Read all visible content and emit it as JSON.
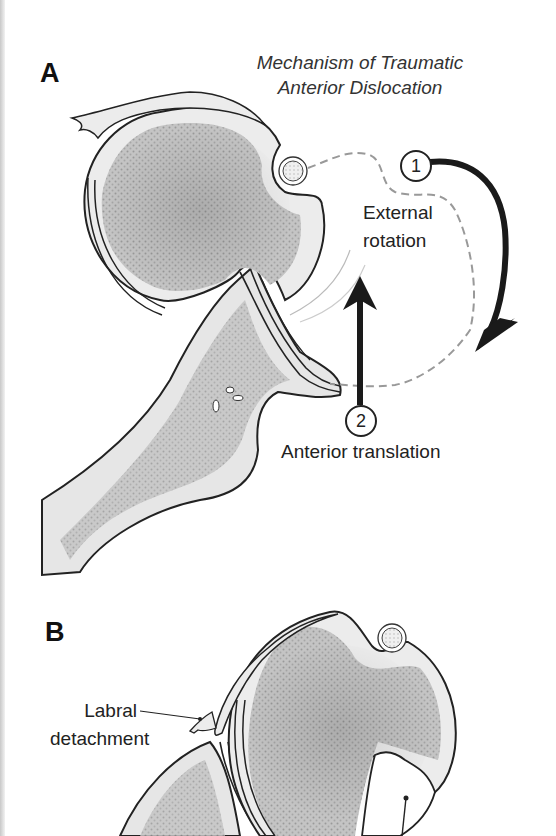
{
  "figure": {
    "panels": [
      {
        "label": "A",
        "title_line1": "Mechanism of Traumatic",
        "title_line2": "Anterior Dislocation",
        "steps": [
          {
            "number": "1",
            "label_line1": "External",
            "label_line2": "rotation"
          },
          {
            "number": "2",
            "label": "Anterior translation"
          }
        ]
      },
      {
        "label": "B",
        "annotations": [
          {
            "label_line1": "Labral",
            "label_line2": "detachment"
          }
        ]
      }
    ],
    "colors": {
      "outline": "#222222",
      "bone_fill": "#e4e4e4",
      "cancellous": "#b5b5b5",
      "dashed_path": "#999999",
      "arrow": "#1a1a1a"
    }
  }
}
